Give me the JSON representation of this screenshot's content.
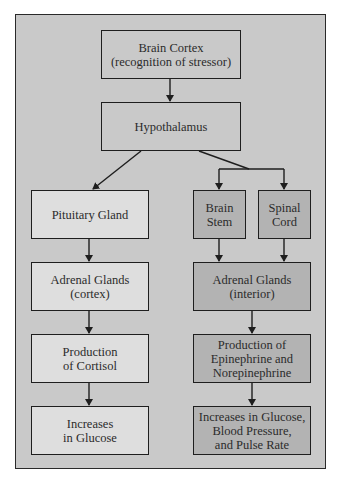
{
  "diagram": {
    "type": "flowchart",
    "nodes": {
      "brain_cortex": "Brain Cortex\n(recognition of stressor)",
      "hypothalamus": "Hypothalamus",
      "pituitary": "Pituitary Gland",
      "adrenal_cortex": "Adrenal Glands\n(cortex)",
      "cortisol": "Production\nof Cortisol",
      "glucose": "Increases\nin Glucose",
      "brain_stem": "Brain\nStem",
      "spinal_cord": "Spinal\nCord",
      "adrenal_interior": "Adrenal Glands\n(interior)",
      "epinephrine": "Production of\nEpinephrine and\nNorepinephrine",
      "increases_multi": "Increases in Glucose,\nBlood Pressure,\nand Pulse Rate"
    },
    "edges": [
      [
        "brain_cortex",
        "hypothalamus"
      ],
      [
        "hypothalamus",
        "pituitary"
      ],
      [
        "hypothalamus",
        "brain_stem"
      ],
      [
        "hypothalamus",
        "spinal_cord"
      ],
      [
        "pituitary",
        "adrenal_cortex"
      ],
      [
        "adrenal_cortex",
        "cortisol"
      ],
      [
        "cortisol",
        "glucose"
      ],
      [
        "brain_stem",
        "adrenal_interior"
      ],
      [
        "spinal_cord",
        "adrenal_interior"
      ],
      [
        "adrenal_interior",
        "epinephrine"
      ],
      [
        "epinephrine",
        "increases_multi"
      ]
    ],
    "colors": {
      "background": "#c9c9c9",
      "left_branch_fill": "#dedede",
      "right_branch_fill": "#b3b3b3",
      "stroke": "#1e1e1e"
    }
  }
}
